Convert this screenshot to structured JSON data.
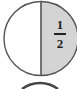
{
  "diagram": {
    "type": "fraction-circle",
    "circles": [
      {
        "shaded_part": "right-half",
        "label": {
          "numerator": "1",
          "denominator": "2"
        },
        "colors": {
          "shade": "#d4d4d4",
          "stroke": "#555555",
          "fill": "#ffffff"
        }
      },
      {
        "partial": true,
        "note": "top of next circle visible"
      }
    ]
  }
}
